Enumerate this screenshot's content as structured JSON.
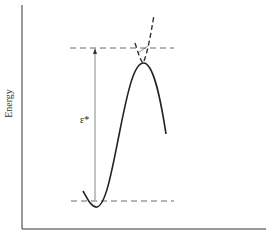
{
  "diagram": {
    "type": "energy-barrier",
    "y_axis_label": "Energy",
    "barrier_label": "ε*",
    "colors": {
      "line": "#222222",
      "dash": "#444444",
      "background": "#ffffff"
    }
  }
}
